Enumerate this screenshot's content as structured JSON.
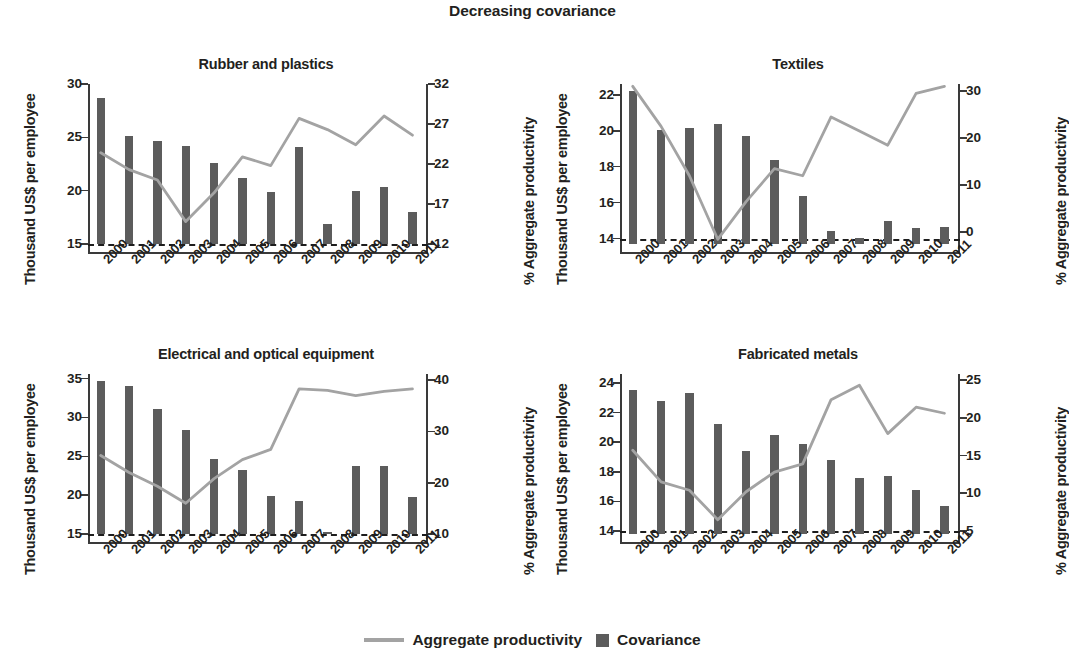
{
  "figure": {
    "title": "Decreasing covariance",
    "legend": [
      {
        "label": "Aggregate productivity",
        "marker": "line",
        "color": "#a3a3a3"
      },
      {
        "label": "Covariance",
        "marker": "square",
        "color": "#5c5c5c"
      }
    ]
  },
  "chart_data": [
    {
      "type": "bar",
      "title": "Rubber and plastics",
      "xlabel": "",
      "ylabel": "Thousand US$ per employee",
      "y2label": "% Aggregate productivity",
      "categories": [
        "2000",
        "2001",
        "2002",
        "2003",
        "2004",
        "2005",
        "2006",
        "2007",
        "2008",
        "2009",
        "2010",
        "2011"
      ],
      "ylim": [
        15,
        30
      ],
      "yticks": [
        15,
        20,
        25,
        30
      ],
      "y2lim": [
        12,
        32
      ],
      "y2ticks": [
        12,
        17,
        22,
        27,
        32
      ],
      "grid": false,
      "legend_position": "bottom",
      "series": [
        {
          "name": "Covariance",
          "kind": "bar",
          "axis": "left",
          "values": [
            28.7,
            25.1,
            24.7,
            24.2,
            22.6,
            21.2,
            19.9,
            24.1,
            16.9,
            20.0,
            20.3,
            18.0
          ]
        },
        {
          "name": "Aggregate productivity",
          "kind": "line",
          "axis": "right",
          "values": [
            23.4,
            21.3,
            20.0,
            14.8,
            18.4,
            22.9,
            21.8,
            27.7,
            26.3,
            24.4,
            28.0,
            25.6
          ]
        }
      ]
    },
    {
      "type": "bar",
      "title": "Textiles",
      "xlabel": "",
      "ylabel": "Thousand US$ per employee",
      "y2label": "% Aggregate productivity",
      "categories": [
        "2000",
        "2001",
        "2002",
        "2003",
        "2004",
        "2005",
        "2006",
        "2007",
        "2008",
        "2009",
        "2010",
        "2011"
      ],
      "ylim": [
        13.7,
        22.6
      ],
      "yticks": [
        14,
        16,
        18,
        20,
        22
      ],
      "y2lim": [
        -2.5,
        31.5
      ],
      "y2ticks": [
        0,
        10,
        20,
        30
      ],
      "grid": false,
      "legend_position": "bottom",
      "series": [
        {
          "name": "Covariance",
          "kind": "bar",
          "axis": "left",
          "values": [
            22.2,
            20.05,
            20.15,
            20.35,
            19.7,
            18.35,
            16.35,
            14.45,
            14.05,
            15.0,
            14.6,
            14.65
          ]
        },
        {
          "name": "Aggregate productivity",
          "kind": "line",
          "axis": "right",
          "values": [
            31.0,
            22.5,
            12.0,
            -1.5,
            6.5,
            13.5,
            12.0,
            24.5,
            21.5,
            18.5,
            29.5,
            31.0
          ]
        }
      ]
    },
    {
      "type": "bar",
      "title": "Electrical and optical equipment",
      "xlabel": "",
      "ylabel": "Thousand US$ per employee",
      "y2label": "% Aggregate productivity",
      "categories": [
        "2000",
        "2001",
        "2002",
        "2003",
        "2004",
        "2005",
        "2006",
        "2007",
        "2008",
        "2009",
        "2010",
        "2011"
      ],
      "ylim": [
        15,
        35.6
      ],
      "yticks": [
        15,
        20,
        25,
        30,
        35
      ],
      "y2lim": [
        10,
        41.2
      ],
      "y2ticks": [
        10,
        20,
        30,
        40
      ],
      "grid": false,
      "legend_position": "bottom",
      "series": [
        {
          "name": "Covariance",
          "kind": "bar",
          "axis": "left",
          "values": [
            34.7,
            34.0,
            31.1,
            28.4,
            24.7,
            23.3,
            19.9,
            19.2,
            15.3,
            23.8,
            23.7,
            19.8
          ]
        },
        {
          "name": "Aggregate productivity",
          "kind": "line",
          "axis": "right",
          "values": [
            25.3,
            22.0,
            19.3,
            16.0,
            20.8,
            24.5,
            26.5,
            38.3,
            38.0,
            37.0,
            37.8,
            38.3
          ]
        }
      ]
    },
    {
      "type": "bar",
      "title": "Fabricated metals",
      "xlabel": "",
      "ylabel": "Thousand US$ per employee",
      "y2label": "% Aggregate productivity",
      "categories": [
        "2000",
        "2001",
        "2002",
        "2003",
        "2004",
        "2005",
        "2006",
        "2007",
        "2008",
        "2009",
        "2010",
        "2011"
      ],
      "ylim": [
        13.8,
        24.6
      ],
      "yticks": [
        14,
        16,
        18,
        20,
        22,
        24
      ],
      "y2lim": [
        4.6,
        25.8
      ],
      "y2ticks": [
        5,
        10,
        15,
        20,
        25
      ],
      "grid": false,
      "legend_position": "bottom",
      "series": [
        {
          "name": "Covariance",
          "kind": "bar",
          "axis": "left",
          "values": [
            23.5,
            22.75,
            23.35,
            21.25,
            19.4,
            20.45,
            19.9,
            18.8,
            17.6,
            17.7,
            16.75,
            15.7
          ]
        },
        {
          "name": "Aggregate productivity",
          "kind": "line",
          "axis": "right",
          "values": [
            15.7,
            11.5,
            10.4,
            6.5,
            10.2,
            12.8,
            13.9,
            22.4,
            24.3,
            17.9,
            21.4,
            20.6
          ]
        }
      ]
    }
  ]
}
